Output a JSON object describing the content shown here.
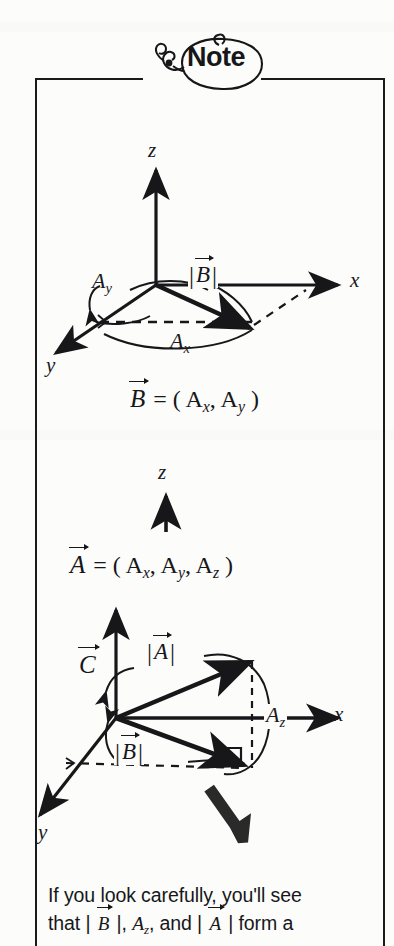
{
  "note": {
    "badge_label": "Note",
    "badge_icon": "note-balloon-icon"
  },
  "diagram_top": {
    "name": "vector-b-projection-diagram",
    "axis_z": "z",
    "axis_x": "x",
    "axis_y": "y",
    "label_ay_base": "A",
    "label_ay_sub": "y",
    "label_ax_base": "A",
    "label_ax_sub": "x",
    "magnitude_b_open": "|",
    "magnitude_b_sym": "B",
    "magnitude_b_close": "|",
    "equation": {
      "vector": "B",
      "rest": " = ( A",
      "sub1": "x",
      "mid": ", A",
      "sub2": "y",
      "end": " )"
    }
  },
  "diagram_bottom": {
    "name": "vector-a-components-diagram",
    "axis_z": "z",
    "axis_x": "x",
    "axis_y": "y",
    "label_c_sym": "C",
    "magnitude_a_open": "|",
    "magnitude_a_sym": "A",
    "magnitude_a_close": "|",
    "magnitude_b_open": "|",
    "magnitude_b_sym": "B",
    "magnitude_b_close": "|",
    "label_az_base": "A",
    "label_az_sub": "z",
    "equation": {
      "vector": "A",
      "rest": " = ( A",
      "sub1": "x",
      "mid": ", A",
      "sub2": "y",
      "mid2": ", A",
      "sub3": "z",
      "end": " )"
    },
    "pointer_icon": "thick-arrow-up-left-icon"
  },
  "caption": {
    "line1": "If you look carefully, you'll see",
    "line2_a": "that | ",
    "line2_b": "B",
    "line2_c": " |, ",
    "line2_d": "A",
    "line2_sub": "z",
    "line2_e": ", and | ",
    "line2_f": "A",
    "line2_g": " | form a"
  },
  "colors": {
    "ink": "#17171a",
    "page": "#fcfcfb"
  }
}
